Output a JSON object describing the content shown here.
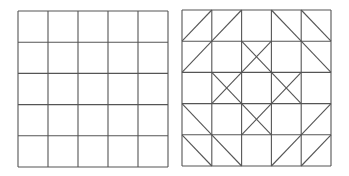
{
  "diagram": {
    "line_color": "#555555",
    "line_width": 1.1,
    "grids": [
      {
        "name": "plain-grid",
        "x0": 18,
        "y0": 11,
        "x1": 168,
        "y1": 167,
        "rows": 5,
        "cols": 5,
        "diagonals": [
          [
            "",
            "",
            "",
            "",
            ""
          ],
          [
            "",
            "",
            "",
            "",
            ""
          ],
          [
            "",
            "",
            "",
            "",
            ""
          ],
          [
            "",
            "",
            "",
            "",
            ""
          ],
          [
            "",
            "",
            "",
            "",
            ""
          ]
        ]
      },
      {
        "name": "diagonal-pattern-grid",
        "x0": 182,
        "y0": 10,
        "x1": 331,
        "y1": 166,
        "rows": 5,
        "cols": 5,
        "diagonals": [
          [
            "/",
            "/",
            "",
            "\\",
            "\\"
          ],
          [
            "/",
            "",
            "X",
            "",
            "\\"
          ],
          [
            "",
            "X",
            "",
            "X",
            ""
          ],
          [
            "\\",
            "",
            "X",
            "",
            "/"
          ],
          [
            "\\",
            "\\",
            "",
            "/",
            "/"
          ]
        ]
      }
    ]
  }
}
